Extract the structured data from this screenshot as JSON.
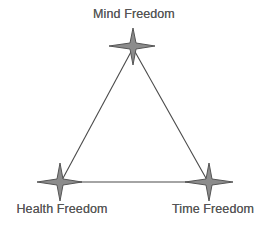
{
  "diagram": {
    "title": "",
    "shape": "triangle",
    "line_color": "#4a4a4a",
    "star_fill": "#8c8c8c",
    "star_stroke": "#555555",
    "label_color": "#555555",
    "nodes": [
      {
        "id": "mind",
        "label": "Mind Freedom",
        "icon": "four-point-star-icon",
        "position": "top"
      },
      {
        "id": "health",
        "label": "Health Freedom",
        "icon": "four-point-star-icon",
        "position": "bottom-left"
      },
      {
        "id": "time",
        "label": "Time Freedom",
        "icon": "four-point-star-icon",
        "position": "bottom-right"
      }
    ],
    "edges": [
      {
        "from": "mind",
        "to": "health"
      },
      {
        "from": "mind",
        "to": "time"
      },
      {
        "from": "health",
        "to": "time"
      }
    ]
  }
}
